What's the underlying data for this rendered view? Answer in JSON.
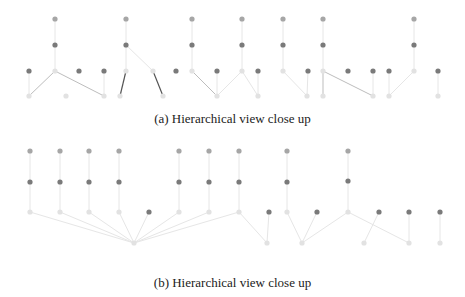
{
  "colors": {
    "node_dark": "#7a7a7a",
    "node_mid": "#a6a6a6",
    "node_light": "#e2e2e2",
    "edge_light": "#e6e6e6",
    "edge_mid": "#bdbdbd",
    "edge_dark": "#555555"
  },
  "panels": [
    {
      "id": "a",
      "caption": "(a) Hierarchical view close up",
      "top": 0,
      "height": 108,
      "nodes": [
        {
          "x": 55,
          "y": 19,
          "c": "mid"
        },
        {
          "x": 55,
          "y": 45,
          "c": "dark"
        },
        {
          "x": 55,
          "y": 71,
          "c": "light"
        },
        {
          "x": 126,
          "y": 19,
          "c": "mid"
        },
        {
          "x": 126,
          "y": 45,
          "c": "dark"
        },
        {
          "x": 126,
          "y": 71,
          "c": "light"
        },
        {
          "x": 192,
          "y": 19,
          "c": "mid"
        },
        {
          "x": 192,
          "y": 45,
          "c": "dark"
        },
        {
          "x": 192,
          "y": 71,
          "c": "light"
        },
        {
          "x": 242,
          "y": 19,
          "c": "mid"
        },
        {
          "x": 242,
          "y": 45,
          "c": "dark"
        },
        {
          "x": 242,
          "y": 71,
          "c": "light"
        },
        {
          "x": 283,
          "y": 19,
          "c": "mid"
        },
        {
          "x": 283,
          "y": 45,
          "c": "dark"
        },
        {
          "x": 283,
          "y": 71,
          "c": "light"
        },
        {
          "x": 323,
          "y": 19,
          "c": "mid"
        },
        {
          "x": 323,
          "y": 45,
          "c": "dark"
        },
        {
          "x": 323,
          "y": 71,
          "c": "light"
        },
        {
          "x": 414,
          "y": 19,
          "c": "mid"
        },
        {
          "x": 414,
          "y": 45,
          "c": "dark"
        },
        {
          "x": 414,
          "y": 71,
          "c": "light"
        },
        {
          "x": 29,
          "y": 71,
          "c": "dark"
        },
        {
          "x": 79,
          "y": 71,
          "c": "dark"
        },
        {
          "x": 104,
          "y": 71,
          "c": "dark"
        },
        {
          "x": 153,
          "y": 71,
          "c": "light"
        },
        {
          "x": 176,
          "y": 71,
          "c": "dark"
        },
        {
          "x": 217,
          "y": 71,
          "c": "dark"
        },
        {
          "x": 258,
          "y": 71,
          "c": "dark"
        },
        {
          "x": 308,
          "y": 71,
          "c": "dark"
        },
        {
          "x": 348,
          "y": 71,
          "c": "dark"
        },
        {
          "x": 373,
          "y": 71,
          "c": "dark"
        },
        {
          "x": 389,
          "y": 71,
          "c": "dark"
        },
        {
          "x": 438,
          "y": 71,
          "c": "dark"
        },
        {
          "x": 29,
          "y": 96,
          "c": "light"
        },
        {
          "x": 66,
          "y": 96,
          "c": "light"
        },
        {
          "x": 104,
          "y": 96,
          "c": "light"
        },
        {
          "x": 120,
          "y": 96,
          "c": "light"
        },
        {
          "x": 163,
          "y": 96,
          "c": "light"
        },
        {
          "x": 217,
          "y": 96,
          "c": "light"
        },
        {
          "x": 258,
          "y": 96,
          "c": "light"
        },
        {
          "x": 307,
          "y": 96,
          "c": "light"
        },
        {
          "x": 323,
          "y": 96,
          "c": "light"
        },
        {
          "x": 373,
          "y": 96,
          "c": "light"
        },
        {
          "x": 389,
          "y": 96,
          "c": "light"
        },
        {
          "x": 438,
          "y": 96,
          "c": "light"
        }
      ],
      "edges": [
        {
          "x1": 55,
          "y1": 19,
          "x2": 55,
          "y2": 71,
          "c": "light"
        },
        {
          "x1": 126,
          "y1": 19,
          "x2": 126,
          "y2": 71,
          "c": "light"
        },
        {
          "x1": 192,
          "y1": 19,
          "x2": 192,
          "y2": 71,
          "c": "light"
        },
        {
          "x1": 242,
          "y1": 19,
          "x2": 242,
          "y2": 71,
          "c": "light"
        },
        {
          "x1": 283,
          "y1": 19,
          "x2": 283,
          "y2": 71,
          "c": "light"
        },
        {
          "x1": 323,
          "y1": 19,
          "x2": 323,
          "y2": 71,
          "c": "light"
        },
        {
          "x1": 414,
          "y1": 19,
          "x2": 414,
          "y2": 71,
          "c": "light"
        },
        {
          "x1": 55,
          "y1": 71,
          "x2": 29,
          "y2": 96,
          "c": "mid"
        },
        {
          "x1": 55,
          "y1": 71,
          "x2": 104,
          "y2": 96,
          "c": "mid"
        },
        {
          "x1": 126,
          "y1": 71,
          "x2": 120,
          "y2": 96,
          "c": "dark"
        },
        {
          "x1": 126,
          "y1": 45,
          "x2": 153,
          "y2": 71,
          "c": "light"
        },
        {
          "x1": 153,
          "y1": 71,
          "x2": 163,
          "y2": 96,
          "c": "dark"
        },
        {
          "x1": 192,
          "y1": 71,
          "x2": 217,
          "y2": 96,
          "c": "mid"
        },
        {
          "x1": 217,
          "y1": 96,
          "x2": 242,
          "y2": 71,
          "c": "light"
        },
        {
          "x1": 217,
          "y1": 71,
          "x2": 217,
          "y2": 96,
          "c": "light"
        },
        {
          "x1": 258,
          "y1": 71,
          "x2": 258,
          "y2": 96,
          "c": "light"
        },
        {
          "x1": 308,
          "y1": 71,
          "x2": 307,
          "y2": 96,
          "c": "light"
        },
        {
          "x1": 283,
          "y1": 71,
          "x2": 307,
          "y2": 96,
          "c": "light"
        },
        {
          "x1": 242,
          "y1": 71,
          "x2": 258,
          "y2": 96,
          "c": "light"
        },
        {
          "x1": 323,
          "y1": 71,
          "x2": 323,
          "y2": 96,
          "c": "mid"
        },
        {
          "x1": 323,
          "y1": 71,
          "x2": 373,
          "y2": 96,
          "c": "mid"
        },
        {
          "x1": 373,
          "y1": 71,
          "x2": 373,
          "y2": 96,
          "c": "light"
        },
        {
          "x1": 389,
          "y1": 71,
          "x2": 389,
          "y2": 96,
          "c": "light"
        },
        {
          "x1": 414,
          "y1": 71,
          "x2": 389,
          "y2": 96,
          "c": "light"
        },
        {
          "x1": 438,
          "y1": 71,
          "x2": 438,
          "y2": 96,
          "c": "light"
        },
        {
          "x1": 29,
          "y1": 71,
          "x2": 29,
          "y2": 96,
          "c": "light"
        },
        {
          "x1": 104,
          "y1": 71,
          "x2": 104,
          "y2": 96,
          "c": "light"
        }
      ]
    },
    {
      "id": "b",
      "caption": "(b) Hierarchical view close up",
      "top": 130,
      "height": 130,
      "nodes": [
        {
          "x": 30,
          "y": 21,
          "c": "mid"
        },
        {
          "x": 30,
          "y": 52,
          "c": "dark"
        },
        {
          "x": 30,
          "y": 82,
          "c": "light"
        },
        {
          "x": 60,
          "y": 21,
          "c": "mid"
        },
        {
          "x": 60,
          "y": 52,
          "c": "dark"
        },
        {
          "x": 60,
          "y": 82,
          "c": "light"
        },
        {
          "x": 89,
          "y": 21,
          "c": "mid"
        },
        {
          "x": 89,
          "y": 52,
          "c": "dark"
        },
        {
          "x": 89,
          "y": 82,
          "c": "light"
        },
        {
          "x": 119,
          "y": 21,
          "c": "mid"
        },
        {
          "x": 119,
          "y": 52,
          "c": "dark"
        },
        {
          "x": 119,
          "y": 82,
          "c": "light"
        },
        {
          "x": 179,
          "y": 21,
          "c": "mid"
        },
        {
          "x": 179,
          "y": 52,
          "c": "dark"
        },
        {
          "x": 179,
          "y": 82,
          "c": "light"
        },
        {
          "x": 209,
          "y": 21,
          "c": "mid"
        },
        {
          "x": 209,
          "y": 52,
          "c": "dark"
        },
        {
          "x": 209,
          "y": 82,
          "c": "light"
        },
        {
          "x": 239,
          "y": 21,
          "c": "mid"
        },
        {
          "x": 239,
          "y": 52,
          "c": "dark"
        },
        {
          "x": 239,
          "y": 82,
          "c": "light"
        },
        {
          "x": 287,
          "y": 21,
          "c": "mid"
        },
        {
          "x": 287,
          "y": 52,
          "c": "dark"
        },
        {
          "x": 287,
          "y": 82,
          "c": "light"
        },
        {
          "x": 348,
          "y": 21,
          "c": "mid"
        },
        {
          "x": 348,
          "y": 51,
          "c": "dark"
        },
        {
          "x": 348,
          "y": 82,
          "c": "light"
        },
        {
          "x": 149,
          "y": 82,
          "c": "dark"
        },
        {
          "x": 269,
          "y": 82,
          "c": "dark"
        },
        {
          "x": 317,
          "y": 82,
          "c": "dark"
        },
        {
          "x": 379,
          "y": 82,
          "c": "dark"
        },
        {
          "x": 409,
          "y": 82,
          "c": "dark"
        },
        {
          "x": 440,
          "y": 82,
          "c": "dark"
        },
        {
          "x": 134,
          "y": 113,
          "c": "light"
        },
        {
          "x": 267,
          "y": 113,
          "c": "light"
        },
        {
          "x": 302,
          "y": 113,
          "c": "light"
        },
        {
          "x": 364,
          "y": 113,
          "c": "light"
        },
        {
          "x": 409,
          "y": 113,
          "c": "light"
        },
        {
          "x": 440,
          "y": 113,
          "c": "light"
        }
      ],
      "edges": [
        {
          "x1": 30,
          "y1": 21,
          "x2": 30,
          "y2": 82,
          "c": "light"
        },
        {
          "x1": 60,
          "y1": 21,
          "x2": 60,
          "y2": 82,
          "c": "light"
        },
        {
          "x1": 89,
          "y1": 21,
          "x2": 89,
          "y2": 82,
          "c": "light"
        },
        {
          "x1": 119,
          "y1": 21,
          "x2": 119,
          "y2": 82,
          "c": "light"
        },
        {
          "x1": 179,
          "y1": 21,
          "x2": 179,
          "y2": 82,
          "c": "light"
        },
        {
          "x1": 209,
          "y1": 21,
          "x2": 209,
          "y2": 82,
          "c": "light"
        },
        {
          "x1": 239,
          "y1": 21,
          "x2": 239,
          "y2": 82,
          "c": "light"
        },
        {
          "x1": 287,
          "y1": 21,
          "x2": 287,
          "y2": 82,
          "c": "light"
        },
        {
          "x1": 348,
          "y1": 21,
          "x2": 348,
          "y2": 82,
          "c": "light"
        },
        {
          "x1": 30,
          "y1": 82,
          "x2": 134,
          "y2": 113,
          "c": "light"
        },
        {
          "x1": 60,
          "y1": 82,
          "x2": 134,
          "y2": 113,
          "c": "light"
        },
        {
          "x1": 89,
          "y1": 82,
          "x2": 134,
          "y2": 113,
          "c": "light"
        },
        {
          "x1": 119,
          "y1": 82,
          "x2": 134,
          "y2": 113,
          "c": "light"
        },
        {
          "x1": 149,
          "y1": 82,
          "x2": 134,
          "y2": 113,
          "c": "light"
        },
        {
          "x1": 179,
          "y1": 82,
          "x2": 134,
          "y2": 113,
          "c": "light"
        },
        {
          "x1": 209,
          "y1": 82,
          "x2": 134,
          "y2": 113,
          "c": "light"
        },
        {
          "x1": 239,
          "y1": 82,
          "x2": 134,
          "y2": 113,
          "c": "light"
        },
        {
          "x1": 239,
          "y1": 82,
          "x2": 267,
          "y2": 113,
          "c": "light"
        },
        {
          "x1": 269,
          "y1": 82,
          "x2": 267,
          "y2": 113,
          "c": "light"
        },
        {
          "x1": 287,
          "y1": 82,
          "x2": 302,
          "y2": 113,
          "c": "light"
        },
        {
          "x1": 317,
          "y1": 82,
          "x2": 302,
          "y2": 113,
          "c": "light"
        },
        {
          "x1": 348,
          "y1": 82,
          "x2": 302,
          "y2": 113,
          "c": "light"
        },
        {
          "x1": 379,
          "y1": 82,
          "x2": 364,
          "y2": 113,
          "c": "light"
        },
        {
          "x1": 348,
          "y1": 82,
          "x2": 409,
          "y2": 113,
          "c": "light"
        },
        {
          "x1": 409,
          "y1": 82,
          "x2": 409,
          "y2": 113,
          "c": "light"
        },
        {
          "x1": 440,
          "y1": 82,
          "x2": 440,
          "y2": 113,
          "c": "light"
        }
      ]
    }
  ],
  "captions": {
    "a": "(a) Hierarchical view close up",
    "b": "(b) Hierarchical view close up"
  }
}
